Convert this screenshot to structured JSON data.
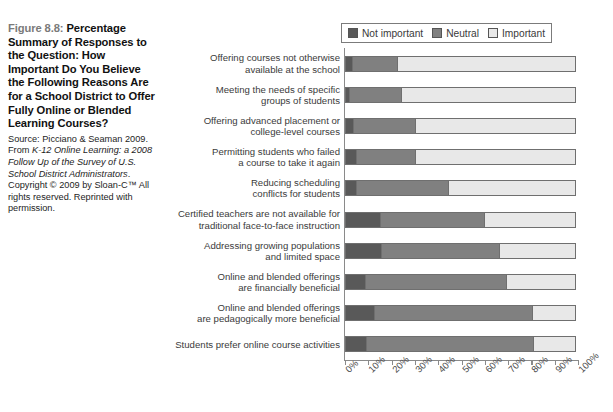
{
  "caption": {
    "figure_number": "Figure 8.8:",
    "title": " Percentage Summary of Responses to the Question: How Important Do You Believe the Following Reasons Are for a School District to Offer Fully Online or Blended Learning Courses?",
    "source_line1": "Source: Picciano & Seaman 2009.",
    "source_line2_pre": "From ",
    "source_line2_italic": "K-12 Online Learning: a 2008 Follow Up of the Survey of U.S. School District Administrators",
    "source_line2_post": ".",
    "source_line3": "Copyright © 2009 by Sloan-C™ All rights reserved. Reprinted with permission."
  },
  "legend": {
    "items": [
      {
        "label": "Not important",
        "color": "#595959"
      },
      {
        "label": "Neutral",
        "color": "#808080"
      },
      {
        "label": "Important",
        "color": "#e8e8e8"
      }
    ]
  },
  "chart_data": {
    "type": "bar",
    "orientation": "horizontal",
    "stacked": true,
    "normalized_percent": true,
    "title": "",
    "xlabel": "",
    "ylabel": "",
    "xlim": [
      0,
      100
    ],
    "grid": false,
    "legend_position": "top-right",
    "tick_labels": [
      "0%",
      "10%",
      "20%",
      "30%",
      "40%",
      "50%",
      "60%",
      "70%",
      "80%",
      "90%",
      "100%"
    ],
    "tick_values": [
      0,
      10,
      20,
      30,
      40,
      50,
      60,
      70,
      80,
      90,
      100
    ],
    "categories": [
      "Offering courses not otherwise available at the school",
      "Meeting the needs of specific groups of students",
      "Offering advanced placement or college-level courses",
      "Permitting students who failed a course to take it again",
      "Reducing scheduling conflicts for students",
      "Certified teachers are not available for traditional face-to-face instruction",
      "Addressing growing populations and limited space",
      "Online and blended offerings are financially beneficial",
      "Online and blended offerings are pedagogically more beneficial",
      "Students prefer online course activities"
    ],
    "category_lines": [
      [
        "Offering courses not otherwise",
        "available at the school"
      ],
      [
        "Meeting the needs of specific",
        "groups of students"
      ],
      [
        "Offering advanced placement or",
        "college-level courses"
      ],
      [
        "Permitting students who failed",
        "a course to take it again"
      ],
      [
        "Reducing scheduling",
        "conflicts for students"
      ],
      [
        "Certified teachers are not available for",
        "traditional face-to-face instruction"
      ],
      [
        "Addressing growing populations",
        "and limited space"
      ],
      [
        "Online and blended offerings",
        "are financially beneficial"
      ],
      [
        "Online and blended offerings",
        "are pedagogically more beneficial"
      ],
      [
        "Students prefer online course activities"
      ]
    ],
    "series": [
      {
        "name": "Not important",
        "color": "#595959",
        "values": [
          3.5,
          2,
          4,
          5,
          5,
          15.5,
          16,
          9,
          13,
          9.5
        ]
      },
      {
        "name": "Neutral",
        "color": "#808080",
        "values": [
          19.5,
          23,
          27,
          26,
          40,
          45,
          51,
          61,
          68,
          72
        ]
      },
      {
        "name": "Important",
        "color": "#e8e8e8",
        "values": [
          77,
          75,
          69,
          69,
          55,
          39.5,
          33,
          30,
          19,
          18.5
        ]
      }
    ]
  }
}
